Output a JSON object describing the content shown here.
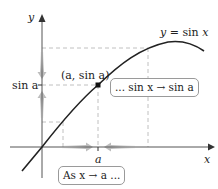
{
  "diagram": {
    "axes": {
      "x_label": "x",
      "y_label": "y"
    },
    "curve_label": "y = sin x",
    "point_label": "(a, sin a)",
    "y_tick_label": "sin a",
    "x_tick_label": "a",
    "annotation_x": "As x → a ...",
    "annotation_y": "... sin x → sin a",
    "colors": {
      "curve": "#222222",
      "axes": "#555555",
      "dashed": "#b0b0b0",
      "arrows": "#c8c8c8",
      "point": "#111111",
      "box_border": "#9a9a9a"
    }
  }
}
